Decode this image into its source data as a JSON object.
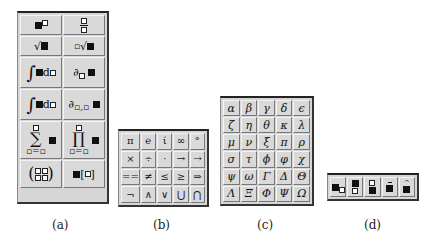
{
  "palettes": {
    "a": {
      "caption": "(a)",
      "templates": [
        {
          "name": "superscript-template",
          "glyph": "■▫"
        },
        {
          "name": "fraction-template",
          "glyph": "▫/▫"
        },
        {
          "name": "square-root-template",
          "glyph": "√■"
        },
        {
          "name": "nth-root-template",
          "glyph": "∜■"
        },
        {
          "name": "integral-template",
          "glyph": "∫■d▫"
        },
        {
          "name": "partial-derivative-template",
          "glyph": "∂▫ ■"
        },
        {
          "name": "definite-integral-template",
          "glyph": "∫▫▫ ■d▫"
        },
        {
          "name": "mixed-partial-template",
          "glyph": "∂▫,▫ ■"
        },
        {
          "name": "summation-template",
          "glyph": "∑ ■"
        },
        {
          "name": "product-template",
          "glyph": "∏ ■"
        },
        {
          "name": "matrix-template",
          "glyph": "(▫▫ ▫▫)"
        },
        {
          "name": "subscript-index-template",
          "glyph": "■[▫]"
        }
      ]
    },
    "b": {
      "caption": "(b)",
      "symbols": [
        "π",
        "℮",
        "ί",
        "∞",
        "°",
        "×",
        "÷",
        "·",
        "→",
        "⇢",
        "==",
        "≠",
        "≤",
        "≥",
        "⇒",
        "¬",
        "∧",
        "∨",
        "⋃",
        "⋂"
      ]
    },
    "c": {
      "caption": "(c)",
      "symbols": [
        "α",
        "β",
        "γ",
        "δ",
        "ϵ",
        "ζ",
        "η",
        "θ",
        "κ",
        "λ",
        "μ",
        "ν",
        "ξ",
        "π",
        "ρ",
        "σ",
        "τ",
        "ϕ",
        "φ",
        "χ",
        "ψ",
        "ω",
        "Γ",
        "Δ",
        "Θ",
        "Λ",
        "Ξ",
        "Φ",
        "Ψ",
        "Ω"
      ]
    },
    "d": {
      "caption": "(d)",
      "templates": [
        {
          "name": "subscript-template",
          "glyph": "■▫"
        },
        {
          "name": "underscript-template",
          "glyph": "■̲"
        },
        {
          "name": "overscript-template",
          "glyph": "▫■"
        },
        {
          "name": "bar-accent-template",
          "glyph": "■̄"
        },
        {
          "name": "hat-accent-template",
          "glyph": "■̂"
        }
      ]
    }
  }
}
